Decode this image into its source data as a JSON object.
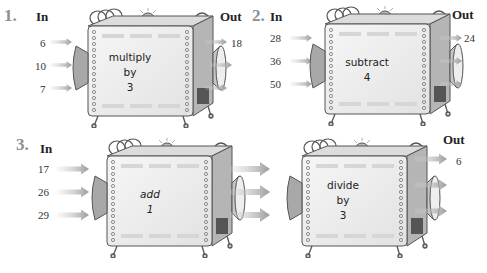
{
  "problems": [
    {
      "number": "1.",
      "in_label": "In",
      "out_label": "Out",
      "inputs": [
        "6",
        "10",
        "7"
      ],
      "rule": [
        "multiply",
        "by",
        "3"
      ],
      "outputs": [
        "18",
        "",
        ""
      ]
    },
    {
      "number": "2.",
      "in_label": "In",
      "out_label": "Out",
      "inputs": [
        "28",
        "36",
        "50"
      ],
      "rule": [
        "subtract",
        "4"
      ],
      "outputs": [
        "24",
        "",
        ""
      ]
    },
    {
      "number": "3.",
      "in_label": "In",
      "out_label": "Out",
      "inputs": [
        "17",
        "26",
        "29"
      ],
      "rule_first": [
        "add",
        "1"
      ],
      "rule_second": [
        "divide",
        "by",
        "3"
      ],
      "outputs": [
        "6",
        "",
        ""
      ]
    }
  ],
  "colors": {
    "problem_number": "#8a8f98",
    "arrow": "#a9a9a9",
    "machine_body": "#ececec",
    "machine_outline": "#555555"
  }
}
